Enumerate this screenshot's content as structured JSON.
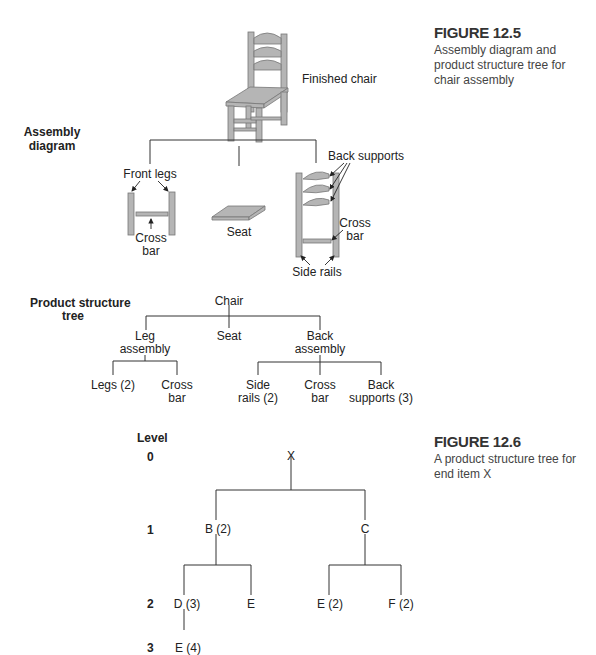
{
  "fig125": {
    "title": "FIGURE 12.5",
    "caption": "Assembly diagram and product structure tree for chair assembly"
  },
  "assembly": {
    "section_label_line1": "Assembly",
    "section_label_line2": "diagram",
    "finished_chair": "Finished chair",
    "front_legs": "Front legs",
    "cross_bar_left_line1": "Cross",
    "cross_bar_left_line2": "bar",
    "seat": "Seat",
    "back_supports": "Back supports",
    "cross_bar_right_line1": "Cross",
    "cross_bar_right_line2": "bar",
    "side_rails": "Side rails"
  },
  "pst": {
    "section_label_line1": "Product structure",
    "section_label_line2": "tree",
    "root": "Chair",
    "leg_assembly_line1": "Leg",
    "leg_assembly_line2": "assembly",
    "seat": "Seat",
    "back_assembly_line1": "Back",
    "back_assembly_line2": "assembly",
    "legs": "Legs (2)",
    "leg_cross_line1": "Cross",
    "leg_cross_line2": "bar",
    "side_rails_line1": "Side",
    "side_rails_line2": "rails (2)",
    "back_cross_line1": "Cross",
    "back_cross_line2": "bar",
    "back_supports_line1": "Back",
    "back_supports_line2": "supports (3)"
  },
  "fig126": {
    "title": "FIGURE 12.6",
    "caption": "A product structure tree for end item X",
    "level_header": "Level",
    "levels": [
      "0",
      "1",
      "2",
      "3"
    ],
    "nodes": {
      "x": "X",
      "b": "B (2)",
      "c": "C",
      "d": "D (3)",
      "e_under_b": "E",
      "e_under_c": "E (2)",
      "f": "F (2)",
      "e_under_d": "E (4)"
    }
  }
}
